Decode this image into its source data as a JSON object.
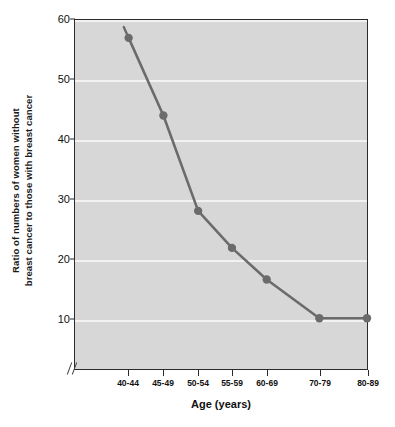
{
  "chart_data": {
    "type": "line",
    "title": "",
    "xlabel": "Age (years)",
    "ylabel_line1": "Ratio of numbers of women without",
    "ylabel_line2": "breast cancer to those with breast cancer",
    "categories": [
      "40-44",
      "45-49",
      "50-54",
      "55-59",
      "60-69",
      "70-79",
      "80-89"
    ],
    "values": [
      57,
      44,
      28,
      21.8,
      16.5,
      10,
      10
    ],
    "yticks": [
      10,
      20,
      30,
      40,
      50,
      60
    ],
    "ylim": [
      0,
      60
    ],
    "grid": "horizontal",
    "legend": "none",
    "axis_break_x": true,
    "plot_background": "#d7d7d7",
    "gridline_color": "#f2f2f2",
    "series_color": "#6b6b6b",
    "marker_color": "#6b6b6b",
    "axis_color": "#2b2b2b"
  }
}
